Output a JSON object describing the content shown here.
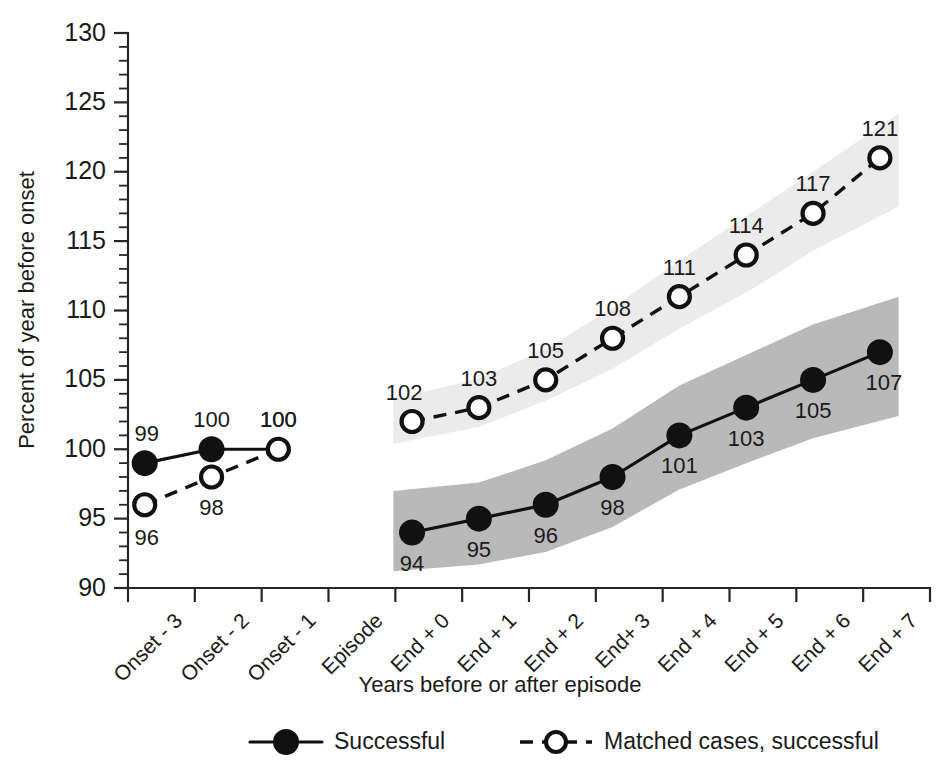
{
  "chart_data": {
    "type": "line",
    "title": "",
    "xlabel": "Years before or after episode",
    "ylabel": "Percent of year before onset",
    "ylim": [
      90,
      130
    ],
    "ytick_step": 5,
    "yminor_step": 1,
    "grid": false,
    "legend_position": "bottom",
    "categories": [
      "Onset - 3",
      "Onset - 2",
      "Onset - 1",
      "Episode",
      "End + 0",
      "End + 1",
      "End + 2",
      "End+ 3",
      "End + 4",
      "End + 5",
      "End + 6",
      "End + 7"
    ],
    "ytick_labels": [
      "90",
      "95",
      "100",
      "105",
      "110",
      "115",
      "120",
      "125",
      "130"
    ],
    "series": [
      {
        "name": "Successful",
        "marker": "filled-circle",
        "line": "solid",
        "color": "#111111",
        "band_color": "#b9b9b9",
        "values": [
          99,
          100,
          100,
          null,
          94,
          95,
          96,
          98,
          101,
          103,
          105,
          107
        ],
        "labels": [
          "99",
          "100",
          "100",
          "",
          "94",
          "95",
          "96",
          "98",
          "101",
          "103",
          "105",
          "107"
        ],
        "label_side": [
          "above",
          "above",
          "above",
          "",
          "below",
          "below",
          "below",
          "below",
          "below",
          "below",
          "below",
          "below"
        ],
        "band_lower": [
          null,
          null,
          null,
          null,
          91.2,
          91.7,
          92.6,
          94.4,
          97.1,
          99.0,
          100.8,
          102.4
        ],
        "band_upper": [
          null,
          null,
          null,
          null,
          97.0,
          97.6,
          99.2,
          101.5,
          104.6,
          106.8,
          109.0,
          111.0
        ]
      },
      {
        "name": "Matched cases, successful",
        "marker": "open-circle",
        "line": "dashed",
        "color": "#111111",
        "band_color": "#ebebeb",
        "values": [
          96,
          98,
          100,
          null,
          102,
          103,
          105,
          108,
          111,
          114,
          117,
          121
        ],
        "labels": [
          "96",
          "98",
          "100",
          "",
          "102",
          "103",
          "105",
          "108",
          "111",
          "114",
          "117",
          "121"
        ],
        "label_side": [
          "below",
          "below",
          "above",
          "",
          "above",
          "above",
          "above",
          "above",
          "above",
          "above",
          "above",
          "above"
        ],
        "band_lower": [
          null,
          null,
          null,
          null,
          100.4,
          101.6,
          103.5,
          105.8,
          108.7,
          111.3,
          114.3,
          117.5
        ],
        "band_upper": [
          null,
          null,
          null,
          null,
          103.6,
          105.1,
          107.2,
          110.2,
          113.6,
          116.8,
          120.0,
          124.2
        ]
      }
    ],
    "annotations": []
  },
  "legend": {
    "items": [
      {
        "label": "Successful",
        "style": "solid-filled"
      },
      {
        "label": "Matched cases, successful",
        "style": "dashed-open"
      }
    ]
  }
}
